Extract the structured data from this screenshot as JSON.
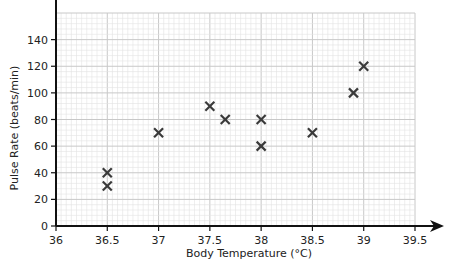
{
  "chart_data": {
    "type": "scatter",
    "title": "",
    "xlabel": "Body Temperature (°C)",
    "ylabel": "Pulse Rate (beats/min)",
    "xlim": [
      36,
      39.5
    ],
    "ylim": [
      0,
      160
    ],
    "x_ticks": [
      36,
      36.5,
      37,
      37.5,
      38,
      38.5,
      39,
      39.5
    ],
    "x_tick_labels": [
      "36",
      "36.5",
      "37",
      "37.5",
      "38",
      "38.5",
      "39",
      "39.5"
    ],
    "y_ticks": [
      0,
      20,
      40,
      60,
      80,
      100,
      120,
      140
    ],
    "y_tick_labels": [
      "0",
      "20",
      "40",
      "60",
      "80",
      "100",
      "120",
      "140"
    ],
    "grid": true,
    "legend": null,
    "marker": "x",
    "series": [
      {
        "name": "Patients",
        "points": [
          {
            "x": 36.5,
            "y": 40
          },
          {
            "x": 36.5,
            "y": 30
          },
          {
            "x": 37.0,
            "y": 70
          },
          {
            "x": 37.5,
            "y": 90
          },
          {
            "x": 37.65,
            "y": 80
          },
          {
            "x": 38.0,
            "y": 80
          },
          {
            "x": 38.0,
            "y": 60
          },
          {
            "x": 38.5,
            "y": 70
          },
          {
            "x": 38.9,
            "y": 100
          },
          {
            "x": 39.0,
            "y": 120
          }
        ]
      }
    ]
  },
  "colors": {
    "axis": "#111111",
    "grid_minor": "#e3e3e3",
    "grid_major": "#c8c8c8",
    "marker": "#3a3a3a",
    "text": "#222222"
  }
}
